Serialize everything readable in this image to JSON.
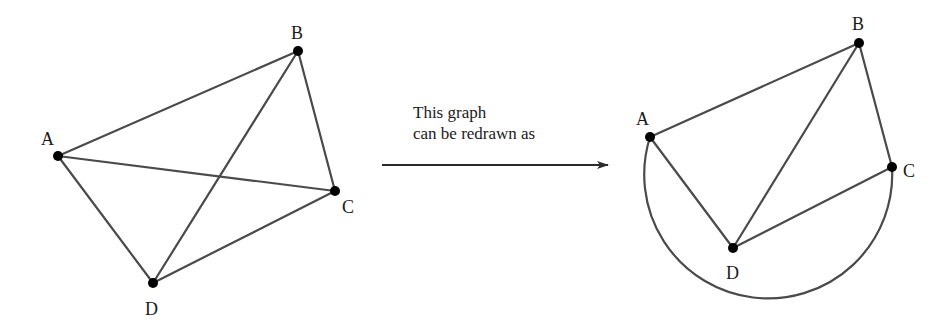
{
  "diagram": {
    "type": "graph-redraw",
    "original_graph": {
      "vertices": [
        {
          "id": "A",
          "label": "A",
          "x": 58,
          "y": 156,
          "lx": 41,
          "ly": 145
        },
        {
          "id": "B",
          "label": "B",
          "x": 298,
          "y": 51,
          "lx": 291,
          "ly": 39
        },
        {
          "id": "C",
          "label": "C",
          "x": 335,
          "y": 191,
          "lx": 342,
          "ly": 213
        },
        {
          "id": "D",
          "label": "D",
          "x": 153,
          "y": 283,
          "lx": 145,
          "ly": 315
        }
      ],
      "edges": [
        [
          "A",
          "B"
        ],
        [
          "A",
          "C"
        ],
        [
          "A",
          "D"
        ],
        [
          "B",
          "C"
        ],
        [
          "B",
          "D"
        ],
        [
          "C",
          "D"
        ]
      ]
    },
    "arrow": {
      "caption_line1": "This graph",
      "caption_line2": "can be redrawn as",
      "x1": 382,
      "x2": 608,
      "y": 165
    },
    "redrawn_graph": {
      "vertices": [
        {
          "id": "A",
          "label": "A",
          "x": 650,
          "y": 137,
          "lx": 636,
          "ly": 125
        },
        {
          "id": "B",
          "label": "B",
          "x": 859,
          "y": 43,
          "lx": 852,
          "ly": 30
        },
        {
          "id": "C",
          "label": "C",
          "x": 892,
          "y": 167,
          "lx": 903,
          "ly": 177
        },
        {
          "id": "D",
          "label": "D",
          "x": 733,
          "y": 248,
          "lx": 726,
          "ly": 279
        }
      ],
      "edges": [
        [
          "A",
          "B"
        ],
        [
          "A",
          "D"
        ],
        [
          "B",
          "D"
        ],
        [
          "B",
          "C"
        ],
        [
          "C",
          "D"
        ]
      ],
      "curved_edges": [
        [
          "A",
          "C"
        ]
      ]
    }
  }
}
